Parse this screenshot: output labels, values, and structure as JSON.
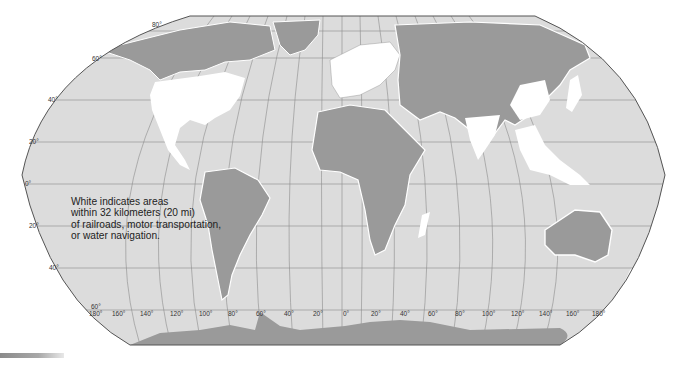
{
  "map": {
    "projection": "Robinson",
    "style": "grayscale",
    "colors": {
      "ocean": "#dcdcdc",
      "land_remote": "#9a9a9a",
      "land_accessible": "#ffffff",
      "graticule": "#8c8c8c",
      "outline": "#555555"
    },
    "legend_lines": [
      "White indicates areas",
      "within 32 kilometers (20 mi)",
      "of railroads, motor transportation,",
      "or water navigation."
    ],
    "latitude_labels": {
      "north": [
        "80°",
        "60°",
        "40°",
        "20°"
      ],
      "equator": "0°",
      "south": [
        "20°",
        "40°",
        "60°"
      ]
    },
    "longitude_labels": [
      "180°",
      "160°",
      "140°",
      "120°",
      "100°",
      "80°",
      "60°",
      "40°",
      "20°",
      "0°",
      "20°",
      "40°",
      "60°",
      "80°",
      "100°",
      "120°",
      "140°",
      "160°",
      "180°"
    ]
  }
}
